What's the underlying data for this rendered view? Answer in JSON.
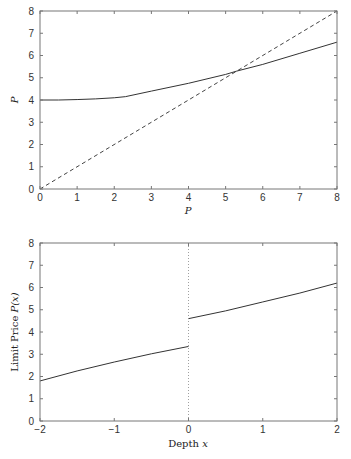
{
  "chart_data": [
    {
      "type": "line",
      "title": "",
      "xlabel": "P",
      "ylabel": "P",
      "xlim": [
        0,
        8
      ],
      "ylim": [
        0,
        8
      ],
      "xticks": [
        "0",
        "1",
        "2",
        "3",
        "4",
        "5",
        "6",
        "7",
        "8"
      ],
      "yticks": [
        "0",
        "1",
        "2",
        "3",
        "4",
        "5",
        "6",
        "7",
        "8"
      ],
      "grid": false,
      "legend": null,
      "series": [
        {
          "name": "mapping",
          "style": "solid",
          "x": [
            0,
            0.5,
            1,
            1.5,
            2,
            2.3,
            3,
            4,
            5,
            5.3,
            6,
            7,
            8
          ],
          "y": [
            4.0,
            4.0,
            4.02,
            4.05,
            4.1,
            4.15,
            4.4,
            4.75,
            5.15,
            5.3,
            5.6,
            6.1,
            6.6
          ]
        },
        {
          "name": "45-degree line",
          "style": "dashed",
          "x": [
            0,
            8
          ],
          "y": [
            0,
            8
          ]
        }
      ],
      "annotations": [
        "intersection near P ≈ 5.3"
      ]
    },
    {
      "type": "line",
      "title": "",
      "xlabel": "Depth x",
      "ylabel": "Limit Price P(x)",
      "xlim": [
        -2,
        2
      ],
      "ylim": [
        0,
        8
      ],
      "xticks": [
        "−2",
        "−1",
        "0",
        "1",
        "2"
      ],
      "yticks": [
        "0",
        "1",
        "2",
        "3",
        "4",
        "5",
        "6",
        "7",
        "8"
      ],
      "grid": false,
      "legend": null,
      "series": [
        {
          "name": "P(x) bid side",
          "style": "solid",
          "x": [
            -2,
            -1.5,
            -1,
            -0.5,
            0
          ],
          "y": [
            1.8,
            2.25,
            2.65,
            3.02,
            3.35
          ]
        },
        {
          "name": "P(x) ask side",
          "style": "solid",
          "x": [
            0,
            0.5,
            1,
            1.5,
            2
          ],
          "y": [
            4.6,
            4.95,
            5.35,
            5.75,
            6.2
          ]
        },
        {
          "name": "x = 0 reference",
          "style": "dotted",
          "x": [
            0,
            0
          ],
          "y": [
            0,
            8
          ]
        }
      ]
    }
  ],
  "labels": {
    "top_xlabel": "P",
    "top_ylabel": "P",
    "bottom_xlabel_text": "Depth ",
    "bottom_xlabel_var": "x",
    "bottom_ylabel_text": "Limit Price ",
    "bottom_ylabel_var": "P(x)"
  }
}
